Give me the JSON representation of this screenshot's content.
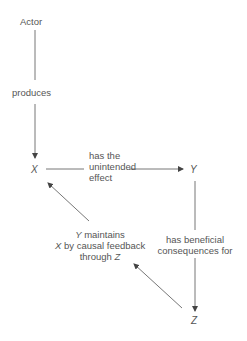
{
  "diagram": {
    "nodes": {
      "actor": "Actor",
      "x": "X",
      "y": "Y",
      "z": "Z"
    },
    "edges": {
      "actor_to_x": "produces",
      "x_to_y_line1": "has the",
      "x_to_y_line2": "unintended",
      "x_to_y_line3": "effect",
      "y_to_z_line1": "has beneficial",
      "y_to_z_line2": "consequences for",
      "z_to_x_line1_var": "Y",
      "z_to_x_line1_rest": " maintains",
      "z_to_x_line2_var": "X",
      "z_to_x_line2_rest": " by causal feedback",
      "z_to_x_line3_pre": "through ",
      "z_to_x_line3_var": "Z"
    },
    "colors": {
      "line": "#555555",
      "text": "#555555"
    }
  }
}
